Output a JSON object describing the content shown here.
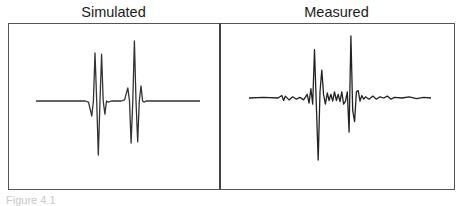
{
  "chart_data": [
    {
      "type": "line",
      "title": "Simulated",
      "xlabel": "",
      "ylabel": "",
      "grid": false,
      "legend": "none",
      "xlim": [
        0,
        100
      ],
      "ylim": [
        -1,
        1
      ],
      "series": [
        {
          "name": "simulated waveform",
          "x": [
            0,
            30,
            32,
            34,
            35,
            36,
            37,
            38,
            39,
            40,
            41,
            42,
            43,
            44,
            46,
            52,
            54,
            56,
            57,
            58,
            59,
            60,
            61,
            62,
            63,
            64,
            65,
            66,
            67,
            69,
            100
          ],
          "y": [
            0,
            0,
            -0.02,
            -0.25,
            0.0,
            0.8,
            0.0,
            -0.9,
            0.0,
            0.78,
            0.0,
            -0.22,
            0.0,
            -0.02,
            0,
            0,
            0.02,
            0.22,
            0.0,
            -0.7,
            0.0,
            1.0,
            0.0,
            -0.68,
            0.0,
            0.25,
            0.0,
            -0.02,
            0,
            0,
            0
          ]
        }
      ]
    },
    {
      "type": "line",
      "title": "Measured",
      "xlabel": "",
      "ylabel": "",
      "grid": false,
      "legend": "none",
      "xlim": [
        0,
        100
      ],
      "ylim": [
        -1,
        1
      ],
      "series": [
        {
          "name": "measured waveform",
          "x": [
            0,
            8,
            16,
            18,
            19,
            20,
            22,
            24,
            26,
            28,
            30,
            32,
            33,
            34,
            35,
            36,
            37,
            38,
            39,
            40,
            41,
            42,
            43,
            44,
            45,
            46,
            47,
            48,
            49,
            50,
            51,
            52,
            53,
            54,
            55,
            56,
            57,
            58,
            59,
            60,
            61,
            62,
            63,
            64,
            66,
            68,
            70,
            72,
            74,
            76,
            78,
            80,
            84,
            88,
            92,
            96,
            100
          ],
          "y": [
            0,
            0.01,
            0,
            0.04,
            -0.04,
            0.03,
            -0.03,
            0.02,
            -0.02,
            0.01,
            -0.03,
            0.06,
            -0.08,
            0.15,
            -0.1,
            0.78,
            -0.1,
            -1.0,
            0.1,
            0.45,
            0.05,
            -0.1,
            0.08,
            -0.04,
            0.06,
            -0.05,
            0.1,
            -0.04,
            0.06,
            -0.06,
            0.1,
            -0.1,
            -0.05,
            0.1,
            -0.55,
            1.0,
            -0.2,
            -0.38,
            0.1,
            0.12,
            -0.05,
            0.04,
            -0.02,
            0.02,
            -0.02,
            0.03,
            -0.02,
            0.02,
            0.0,
            0.03,
            -0.02,
            0.01,
            0.0,
            0.02,
            -0.01,
            0.01,
            0
          ]
        }
      ]
    }
  ],
  "caption": "Figure 4.1"
}
